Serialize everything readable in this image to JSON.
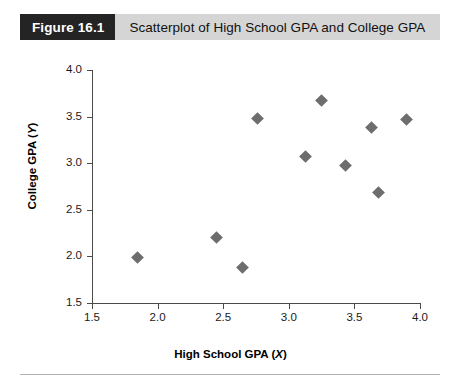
{
  "figure": {
    "number_label": "Figure 16.1",
    "caption": "Scatterplot of High School GPA and College GPA"
  },
  "chart_data": {
    "type": "scatter",
    "title": "Scatterplot of High School GPA and College GPA",
    "xlabel": "High School GPA (X)",
    "xlabel_text": "High School GPA (",
    "xlabel_var": "X",
    "xlabel_tail": ")",
    "ylabel": "College GPA (Y)",
    "ylabel_text": "College GPA (",
    "ylabel_var": "Y",
    "ylabel_tail": ")",
    "xlim": [
      1.5,
      4.0
    ],
    "ylim": [
      1.5,
      4.0
    ],
    "xticks": [
      "1.5",
      "2.0",
      "2.5",
      "3.0",
      "3.5",
      "4.0"
    ],
    "yticks": [
      "4.0",
      "3.5",
      "3.0",
      "2.5",
      "2.0",
      "1.5"
    ],
    "xtick_values": [
      1.5,
      2.0,
      2.5,
      3.0,
      3.5,
      4.0
    ],
    "ytick_values": [
      4.0,
      3.5,
      3.0,
      2.5,
      2.0,
      1.5
    ],
    "grid": false,
    "legend": false,
    "marker": "diamond",
    "marker_color": "#6d6d6d",
    "axis_color": "#4a4a4a",
    "points": [
      {
        "x": 1.85,
        "y": 1.99
      },
      {
        "x": 2.45,
        "y": 2.2
      },
      {
        "x": 2.65,
        "y": 1.88
      },
      {
        "x": 2.76,
        "y": 3.48
      },
      {
        "x": 3.13,
        "y": 3.07
      },
      {
        "x": 3.25,
        "y": 3.67
      },
      {
        "x": 3.43,
        "y": 2.97
      },
      {
        "x": 3.68,
        "y": 2.69
      },
      {
        "x": 3.63,
        "y": 3.38
      },
      {
        "x": 3.9,
        "y": 3.47
      }
    ]
  },
  "colors": {
    "header_band": "#d5d5d5",
    "header_badge": "#242424",
    "marker": "#6d6d6d",
    "rule": "#b3b3b3"
  }
}
